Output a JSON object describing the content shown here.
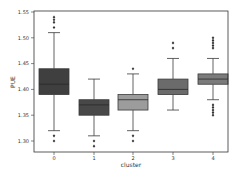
{
  "chart_data": {
    "type": "box",
    "title": "",
    "xlabel": "cluster",
    "ylabel": "PUE",
    "categories": [
      "0",
      "1",
      "2",
      "3",
      "4"
    ],
    "ylim": [
      1.285,
      1.555
    ],
    "yticks": [
      1.3,
      1.35,
      1.4,
      1.45,
      1.5,
      1.55
    ],
    "ytick_labels": [
      "1.30",
      "1.35",
      "1.40",
      "1.45",
      "1.50",
      "1.55"
    ],
    "grid": false,
    "series": [
      {
        "name": "0",
        "color": "#3f3f3f",
        "whisker_low": 1.32,
        "q1": 1.39,
        "median": 1.41,
        "q3": 1.44,
        "whisker_high": 1.51,
        "outliers": [
          1.54,
          1.535,
          1.53,
          1.52,
          1.31,
          1.3
        ]
      },
      {
        "name": "1",
        "color": "#484848",
        "whisker_low": 1.31,
        "q1": 1.35,
        "median": 1.37,
        "q3": 1.38,
        "whisker_high": 1.42,
        "outliers": [
          1.3,
          1.29
        ]
      },
      {
        "name": "2",
        "color": "#9c9c9c",
        "whisker_low": 1.32,
        "q1": 1.36,
        "median": 1.38,
        "q3": 1.39,
        "whisker_high": 1.43,
        "outliers": [
          1.44,
          1.31,
          1.3
        ]
      },
      {
        "name": "3",
        "color": "#6b6b6b",
        "whisker_low": 1.36,
        "q1": 1.39,
        "median": 1.4,
        "q3": 1.42,
        "whisker_high": 1.46,
        "outliers": [
          1.49,
          1.48
        ]
      },
      {
        "name": "4",
        "color": "#7b7b7b",
        "whisker_low": 1.38,
        "q1": 1.41,
        "median": 1.42,
        "q3": 1.43,
        "whisker_high": 1.46,
        "outliers": [
          1.5,
          1.495,
          1.49,
          1.485,
          1.48,
          1.37,
          1.365,
          1.36,
          1.355,
          1.35
        ]
      }
    ]
  }
}
